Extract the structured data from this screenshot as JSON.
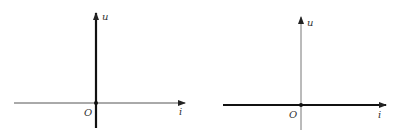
{
  "diagrams": [
    {
      "id": "open-circuit",
      "y_axis_label": "u",
      "x_axis_label": "i",
      "origin_label": "O",
      "characteristic": "vertical line on u-axis (i = 0)"
    },
    {
      "id": "short-circuit",
      "y_axis_label": "u",
      "x_axis_label": "i",
      "origin_label": "O",
      "characteristic": "horizontal line on i-axis (u = 0)"
    }
  ]
}
